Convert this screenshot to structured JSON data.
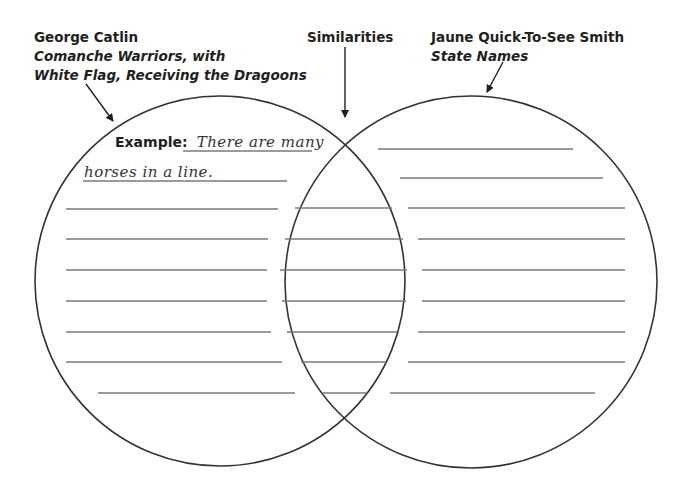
{
  "left_set": {
    "title": "George Catlin",
    "subtitle_line1": "Comanche Warriors, with",
    "subtitle_line2": "White Flag, Receiving the Dragoons"
  },
  "middle_set": {
    "title": "Similarities"
  },
  "right_set": {
    "title": "Jaune Quick-To-See Smith",
    "subtitle": "State Names"
  },
  "example": {
    "label": "Example:",
    "text_line1": "There are many",
    "text_line2": "horses in a line."
  },
  "colors": {
    "circle_stroke": "#333333",
    "writing_line": "#7a7a7a",
    "text": "#231f20"
  },
  "writing_lines": {
    "left": [
      {
        "y": 209,
        "x1": 66,
        "x2": 278
      },
      {
        "y": 239,
        "x1": 66,
        "x2": 268
      },
      {
        "y": 270,
        "x1": 66,
        "x2": 267
      },
      {
        "y": 301,
        "x1": 66,
        "x2": 267
      },
      {
        "y": 332,
        "x1": 66,
        "x2": 271
      },
      {
        "y": 362,
        "x1": 66,
        "x2": 282
      },
      {
        "y": 393,
        "x1": 98,
        "x2": 295
      }
    ],
    "middle": [
      {
        "y": 208,
        "x1": 295,
        "x2": 392
      },
      {
        "y": 239,
        "x1": 285,
        "x2": 403
      },
      {
        "y": 270,
        "x1": 280,
        "x2": 407
      },
      {
        "y": 301,
        "x1": 282,
        "x2": 406
      },
      {
        "y": 332,
        "x1": 287,
        "x2": 397
      },
      {
        "y": 362,
        "x1": 301,
        "x2": 386
      },
      {
        "y": 393,
        "x1": 322,
        "x2": 367
      }
    ],
    "right": [
      {
        "y": 149,
        "x1": 378,
        "x2": 573
      },
      {
        "y": 178,
        "x1": 400,
        "x2": 603
      },
      {
        "y": 208,
        "x1": 408,
        "x2": 625
      },
      {
        "y": 239,
        "x1": 418,
        "x2": 625
      },
      {
        "y": 270,
        "x1": 422,
        "x2": 625
      },
      {
        "y": 301,
        "x1": 422,
        "x2": 625
      },
      {
        "y": 332,
        "x1": 418,
        "x2": 625
      },
      {
        "y": 362,
        "x1": 408,
        "x2": 625
      },
      {
        "y": 393,
        "x1": 390,
        "x2": 595
      }
    ]
  }
}
